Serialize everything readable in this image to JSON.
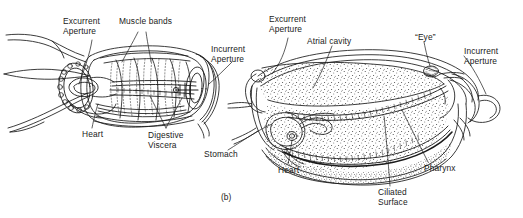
{
  "figure": {
    "caption": "(b)",
    "panels": [
      {
        "id": "left-panel",
        "name": "dorsal-view",
        "labels": [
          {
            "key": "excurrent_aperture",
            "text": "Excurrent\nAperture"
          },
          {
            "key": "muscle_bands",
            "text": "Muscle bands"
          },
          {
            "key": "incurrent_aperture",
            "text": "Incurrent\nAperture"
          },
          {
            "key": "heart",
            "text": "Heart"
          },
          {
            "key": "digestive_viscera",
            "text": "Digestive\nViscera"
          }
        ]
      },
      {
        "id": "right-panel",
        "name": "sagittal-section-view",
        "labels": [
          {
            "key": "excurrent_aperture",
            "text": "Excurrent\nAperture"
          },
          {
            "key": "atrial_cavity",
            "text": "Atrial cavity"
          },
          {
            "key": "eye",
            "text": "“Eye”"
          },
          {
            "key": "incurrent_aperture",
            "text": "Incurrent\nAperture"
          },
          {
            "key": "stomach",
            "text": "Stomach"
          },
          {
            "key": "heart",
            "text": "Heart"
          },
          {
            "key": "ciliated_surface",
            "text": "Ciliated\nSurface"
          },
          {
            "key": "pharynx",
            "text": "Pharynx"
          }
        ]
      }
    ],
    "colors": {
      "ink": "#1a1a1a",
      "paper": "#ffffff",
      "stipple": "#2b2b2b"
    }
  }
}
